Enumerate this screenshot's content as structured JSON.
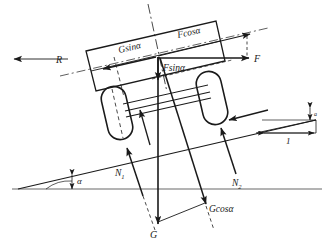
{
  "figure": {
    "type": "free-body-diagram",
    "background_color": "#ffffff",
    "line_color": "#1a1a1a",
    "ground_color": "#9a9a9a"
  },
  "labels": {
    "reaction": "R",
    "g_sin_alpha": "Gsinα",
    "f_cos_alpha": "Fcosα",
    "f_sin_alpha": "Fsinα",
    "force_f": "F",
    "normal_front": "N",
    "normal_front_sub": "1",
    "normal_rear": "N",
    "normal_rear_sub": "2",
    "weight": "G",
    "g_cos_alpha": "Gcosα",
    "angle": "α",
    "run_length": "1",
    "rise_length": "a"
  },
  "geometry": {
    "incline_angle_deg": 13,
    "ground_line_y": 189,
    "incline_origin_x": 18,
    "incline_origin_y": 189
  }
}
